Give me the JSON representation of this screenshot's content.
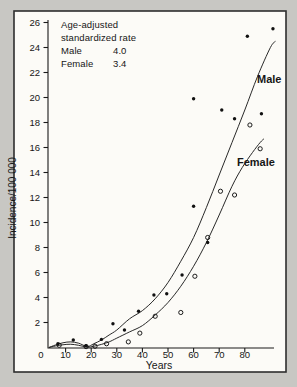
{
  "figure": {
    "legend": {
      "line1": "Age-adjusted",
      "line2": "standardized rate",
      "male_label": "Male",
      "male_value": "4.0",
      "female_label": "Female",
      "female_value": "3.4"
    },
    "curve_labels": {
      "male": "Male",
      "female": "Female"
    },
    "colors": {
      "ink": "#1a1a1a",
      "panel": "#fcfbf7",
      "surround": "#c8c7c3"
    }
  },
  "chart_data": {
    "type": "scatter",
    "title": "",
    "xlabel": "Years",
    "ylabel": "Incidence/100 000",
    "xlim": [
      0,
      92
    ],
    "ylim": [
      0,
      26
    ],
    "xticks": [
      0,
      10,
      20,
      30,
      40,
      50,
      60,
      70,
      80
    ],
    "yticks": [
      2,
      4,
      6,
      8,
      10,
      12,
      14,
      16,
      18,
      20,
      22,
      24,
      26
    ],
    "grid": false,
    "legend_position": "top-left-inside",
    "series": [
      {
        "name": "Male",
        "marker": "filled-dot",
        "points": [
          [
            7,
            0.3
          ],
          [
            13,
            0.6
          ],
          [
            18,
            0.15
          ],
          [
            24,
            0.65
          ],
          [
            28.5,
            1.9
          ],
          [
            33,
            1.4
          ],
          [
            38.5,
            2.9
          ],
          [
            44.5,
            4.2
          ],
          [
            49.5,
            4.3
          ],
          [
            55.5,
            5.8
          ],
          [
            60,
            11.3
          ],
          [
            60,
            19.9
          ],
          [
            65.5,
            8.4
          ],
          [
            71,
            19.0
          ],
          [
            76,
            18.3
          ],
          [
            81,
            24.9
          ],
          [
            86.5,
            18.7
          ],
          [
            91,
            25.5
          ]
        ],
        "fitted_curve": [
          [
            3.5,
            0.0
          ],
          [
            6,
            0.2
          ],
          [
            9,
            0.38
          ],
          [
            12,
            0.45
          ],
          [
            15,
            0.35
          ],
          [
            18.5,
            0.08
          ],
          [
            21,
            0.3
          ],
          [
            24,
            0.6
          ],
          [
            27,
            1.0
          ],
          [
            30,
            1.4
          ],
          [
            35,
            2.3
          ],
          [
            40,
            2.95
          ],
          [
            45,
            3.9
          ],
          [
            50,
            5.2
          ],
          [
            55,
            6.9
          ],
          [
            60,
            8.8
          ],
          [
            65,
            11.2
          ],
          [
            70,
            13.8
          ],
          [
            75,
            16.4
          ],
          [
            80,
            19.0
          ],
          [
            85,
            21.7
          ],
          [
            90,
            24.0
          ],
          [
            92,
            24.5
          ]
        ]
      },
      {
        "name": "Female",
        "marker": "open-circle",
        "points": [
          [
            7.5,
            0.18
          ],
          [
            18,
            0.07
          ],
          [
            21.5,
            0.1
          ],
          [
            26,
            0.3
          ],
          [
            34.5,
            0.45
          ],
          [
            39,
            1.15
          ],
          [
            45,
            2.5
          ],
          [
            55,
            2.8
          ],
          [
            60.5,
            5.7
          ],
          [
            65.5,
            8.8
          ],
          [
            70.5,
            12.5
          ],
          [
            76,
            12.2
          ],
          [
            82,
            17.8
          ],
          [
            86,
            15.9
          ]
        ],
        "fitted_curve": [
          [
            3.5,
            0.0
          ],
          [
            6,
            0.12
          ],
          [
            9,
            0.22
          ],
          [
            12,
            0.26
          ],
          [
            15,
            0.18
          ],
          [
            18.5,
            0.03
          ],
          [
            21,
            0.1
          ],
          [
            24,
            0.25
          ],
          [
            27,
            0.45
          ],
          [
            30,
            0.75
          ],
          [
            35,
            1.25
          ],
          [
            40,
            1.75
          ],
          [
            45,
            2.6
          ],
          [
            50,
            3.6
          ],
          [
            55,
            4.9
          ],
          [
            60,
            6.5
          ],
          [
            65,
            8.4
          ],
          [
            70,
            10.6
          ],
          [
            75,
            12.9
          ],
          [
            79,
            14.4
          ],
          [
            83,
            15.6
          ],
          [
            86,
            16.4
          ],
          [
            87.5,
            16.7
          ]
        ]
      }
    ]
  }
}
